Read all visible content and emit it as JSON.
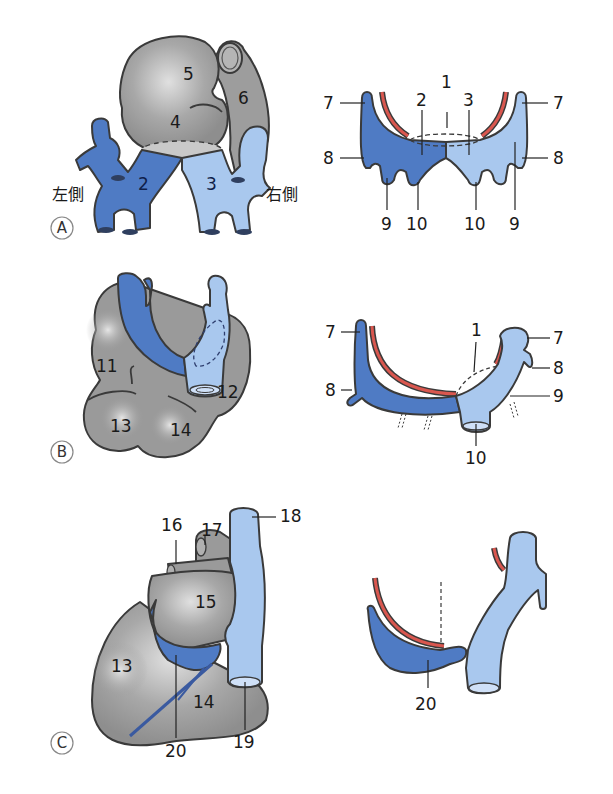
{
  "figure": {
    "colors": {
      "left_horn": "#4f7bc4",
      "right_horn": "#a9c8ee",
      "heart_gray": "#9a9a9a",
      "heart_highlight": "#d6d6d6",
      "red_vessel": "#d9574f",
      "outline": "#3a3a3a"
    },
    "panels": [
      {
        "id": "A",
        "letter": "A",
        "side_left": "左側",
        "side_right": "右側",
        "left_labels": [
          "2",
          "4",
          "5",
          "6",
          "3"
        ],
        "right_labels": [
          "1",
          "2",
          "3",
          "7",
          "7",
          "8",
          "8",
          "9",
          "10",
          "10",
          "9"
        ]
      },
      {
        "id": "B",
        "letter": "B",
        "left_labels": [
          "11",
          "12",
          "13",
          "14"
        ],
        "right_labels": [
          "7",
          "7",
          "1",
          "8",
          "8",
          "9",
          "10"
        ]
      },
      {
        "id": "C",
        "letter": "C",
        "left_labels": [
          "16",
          "17",
          "18",
          "15",
          "13",
          "14",
          "19",
          "20"
        ],
        "right_labels": [
          "20"
        ]
      }
    ]
  }
}
